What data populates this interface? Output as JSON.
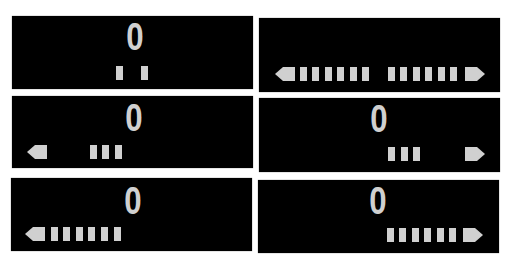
{
  "colors": {
    "panel_bg": "#000000",
    "glyph": "#d0d0d0",
    "page_bg": "#ffffff"
  },
  "panels": [
    {
      "id": "top-left",
      "digit": "0",
      "left_arrow": false,
      "right_arrow": false,
      "left_bars": 0,
      "right_bars": 0,
      "center_marks": 2
    },
    {
      "id": "top-right",
      "digit": "",
      "left_arrow": true,
      "right_arrow": true,
      "left_bars": 6,
      "right_bars": 6
    },
    {
      "id": "middle-left",
      "digit": "0",
      "left_arrow": true,
      "right_arrow": false,
      "left_bars": 3,
      "right_bars": 0
    },
    {
      "id": "middle-right",
      "digit": "0",
      "left_arrow": false,
      "right_arrow": true,
      "left_bars": 0,
      "right_bars": 3
    },
    {
      "id": "bottom-left",
      "digit": "0",
      "left_arrow": true,
      "right_arrow": false,
      "left_bars": 6,
      "right_bars": 0
    },
    {
      "id": "bottom-right",
      "digit": "0",
      "left_arrow": false,
      "right_arrow": true,
      "left_bars": 0,
      "right_bars": 6
    }
  ]
}
